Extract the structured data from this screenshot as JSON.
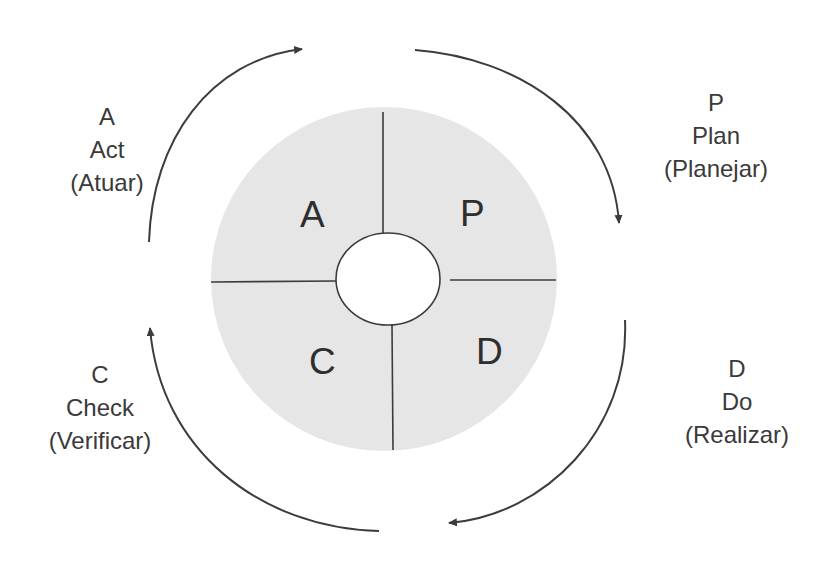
{
  "diagram": {
    "type": "cycle",
    "colors": {
      "disk_fill": "#e6e6e6",
      "line": "#3c3c3c",
      "text": "#3a3a3a",
      "hub_fill": "#ffffff"
    },
    "quadrants": [
      {
        "id": "A",
        "letter": "A"
      },
      {
        "id": "P",
        "letter": "P"
      },
      {
        "id": "D",
        "letter": "D"
      },
      {
        "id": "C",
        "letter": "C"
      }
    ],
    "stages": {
      "plan": {
        "letter": "P",
        "english": "Plan",
        "portuguese": "(Planejar)"
      },
      "do": {
        "letter": "D",
        "english": "Do",
        "portuguese": "(Realizar)"
      },
      "check": {
        "letter": "C",
        "english": "Check",
        "portuguese": "(Verificar)"
      },
      "act": {
        "letter": "A",
        "english": "Act",
        "portuguese": "(Atuar)"
      }
    },
    "arrows": [
      {
        "from": "act",
        "to": "plan",
        "direction": "clockwise"
      },
      {
        "from": "plan",
        "to": "do",
        "direction": "clockwise"
      },
      {
        "from": "do",
        "to": "check",
        "direction": "clockwise"
      },
      {
        "from": "check",
        "to": "act",
        "direction": "clockwise"
      }
    ]
  }
}
